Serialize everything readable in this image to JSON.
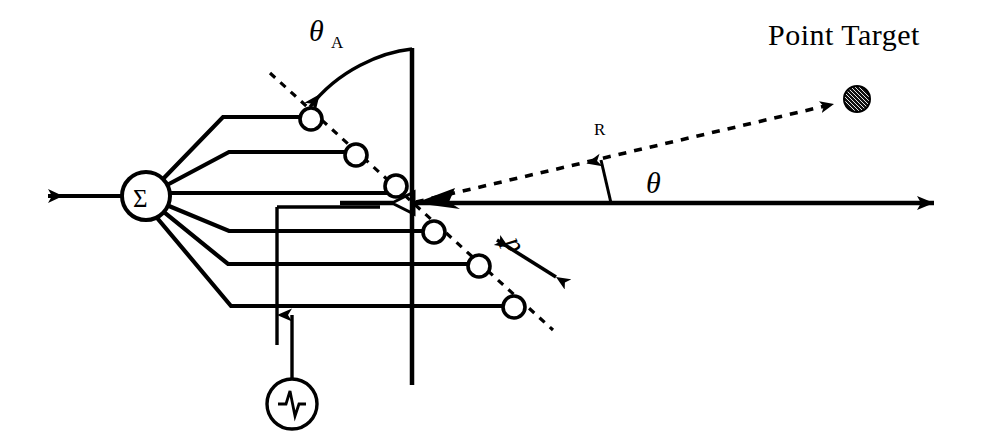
{
  "figure": {
    "background_color": "#ffffff",
    "ink_color": "#000000",
    "width": 983,
    "height": 445
  },
  "labels": {
    "point_target": "Point Target",
    "theta_a_symbol": "θ",
    "theta_a_subscript": "A",
    "theta_symbol": "θ",
    "range_symbol": "R",
    "spacing_symbol": "d",
    "summer_symbol": "Σ"
  },
  "elements": {
    "count": 6,
    "radius": 11,
    "centers": [
      {
        "x": 311,
        "y": 119
      },
      {
        "x": 356,
        "y": 155
      },
      {
        "x": 396,
        "y": 186
      },
      {
        "x": 434,
        "y": 232
      },
      {
        "x": 479,
        "y": 266
      },
      {
        "x": 514,
        "y": 307
      }
    ]
  },
  "nodes": {
    "summer": {
      "x": 146,
      "y": 196,
      "radius": 24
    },
    "signal_generator": {
      "x": 292,
      "y": 404,
      "radius": 25,
      "icon": "pulse-waveform-icon"
    },
    "target_dot": {
      "x": 857,
      "y": 99,
      "radius": 13,
      "fill": "hatched-dark"
    }
  },
  "axes": {
    "boresight": {
      "x1": 41,
      "y1": 203,
      "x2": 950,
      "y2": 203
    },
    "aperture_vertical": {
      "x": 412,
      "y1": 48,
      "y2": 385
    },
    "array_axis_dashed": {
      "x1": 270,
      "y1": 73,
      "x2": 553,
      "y2": 330
    },
    "range_line_dashed": {
      "x1": 412,
      "y1": 203,
      "x2": 857,
      "y2": 99
    }
  },
  "icons": {
    "output_arrow": "left-arrow-icon",
    "boresight_arrow": "right-arrow-icon",
    "target_arrow": "target-arrowhead-icon",
    "theta_arrow": "angle-arrow-icon",
    "theta_a_arc_arrow": "curved-arrow-icon",
    "spacing_arrow": "double-arrow-icon",
    "feed_arrow": "up-arrow-icon",
    "hollow_boresight_head": "hollow-arrowhead-icon"
  }
}
